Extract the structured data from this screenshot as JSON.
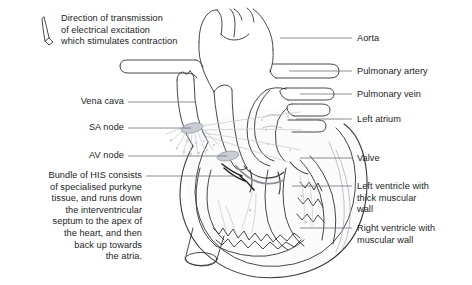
{
  "diagram": {
    "background_color": "#ffffff",
    "ink_color": "#1c1c1c",
    "faint_ink_color": "#b9bcc2",
    "node_fill_color": "#c9ccd2"
  },
  "annotations": {
    "direction_note": "Direction of transmission\nof electrical excitation\nwhich stimulates contraction",
    "vena_cava": "Vena cava",
    "sa_node": "SA node",
    "av_node": "AV node",
    "bundle_of_his": "Bundle of HIS consists\nof specialised purkyne\ntissue, and runs down\nthe interventricular\nseptum to the apex of\nthe heart, and then\nback up towards\nthe atria.",
    "aorta": "Aorta",
    "pulmonary_artery": "Pulmonary artery",
    "pulmonary_vein": "Pulmonary vein",
    "left_atrium": "Left atrium",
    "valve": "Valve",
    "left_ventricle": "Left ventricle with\nthick muscular\nwall",
    "right_ventricle": "Right ventricle with\nmuscular wall"
  },
  "icons": {
    "direction_arrow": "down-arrow-icon"
  }
}
